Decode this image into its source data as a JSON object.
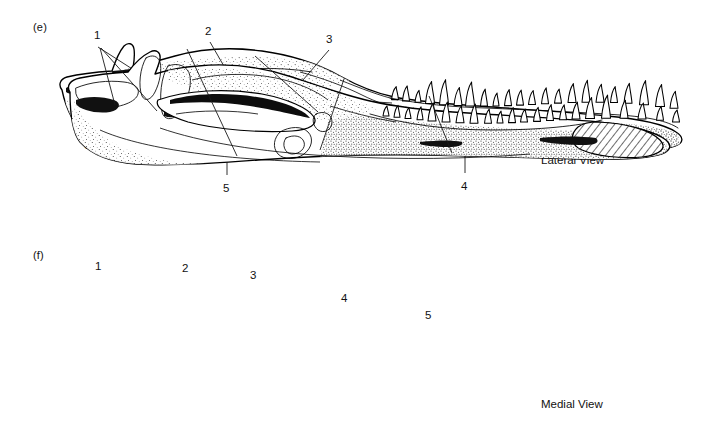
{
  "figure": {
    "background_color": "#ffffff",
    "ink_color": "#000000",
    "panels": [
      {
        "id": "e",
        "letter": "(e)",
        "caption": "Lateral View",
        "caption_x": 541,
        "caption_y": 154,
        "letter_x": 33,
        "letter_y": 21,
        "callouts": [
          {
            "number": "1",
            "label_x": 94,
            "label_y": 30,
            "line": "98,47 L 176,97"
          },
          {
            "number": "2",
            "label_x": 205,
            "label_y": 26,
            "line": "210,42 L 247,106"
          },
          {
            "number": "3",
            "label_x": 326,
            "label_y": 34,
            "line": "329,50 L 296,88"
          },
          {
            "number": "4",
            "label_x": 461,
            "label_y": 181,
            "line": "465,173 L 465,115"
          },
          {
            "number": "5",
            "label_x": 223,
            "label_y": 183,
            "line": "227,175 L 227,116"
          },
          {
            "number": "6",
            "label_x": 84,
            "label_y": 140,
            "line": "90,136 L 73,100"
          }
        ]
      },
      {
        "id": "f",
        "letter": "(f)",
        "caption": "Medial View",
        "caption_x": 541,
        "caption_y": 398,
        "letter_x": 33,
        "letter_y": 249,
        "callouts": [
          {
            "number": "1",
            "label_x": 95,
            "label_y": 261,
            "line": "100,278 L 115,335"
          },
          {
            "number": "1b",
            "number_hidden": true,
            "line": "101,278 L 157,341"
          },
          {
            "number": "2",
            "label_x": 182,
            "label_y": 263,
            "line": "187,279 L 237,386"
          },
          {
            "number": "3",
            "label_x": 250,
            "label_y": 270,
            "line": "255,286 L 318,342"
          },
          {
            "number": "4",
            "label_x": 341,
            "label_y": 293,
            "line": "344,309 L 320,380"
          },
          {
            "number": "5",
            "label_x": 425,
            "label_y": 310,
            "line": "429,326 L 452,383"
          }
        ]
      }
    ]
  },
  "art": {
    "lateral": {
      "jaw_outline": "M 62,90 C 58,85 60,79 67,77 C 80,74 98,72 112,71 C 115,62 119,52 124,46 C 128,42 133,43 134,49 C 135,55 134,62 133,68 C 146,64 160,60 175,56 C 200,49 232,47 262,51 C 292,55 318,64 340,76 C 358,86 375,93 394,97 C 420,102 450,104 478,106 C 520,109 566,112 607,116 C 640,119 664,124 676,132 C 684,137 684,143 675,146 C 660,151 634,152 604,151 C 560,150 505,148 455,147 C 400,146 340,148 286,152 C 232,156 186,159 152,158 C 124,157 104,151 90,140 C 76,129 66,110 62,90 Z",
      "ramus_upper_edge": "M 86,92 C 120,86 156,80 196,74 C 236,68 276,66 312,72",
      "ramus_lower_edge": "M 76,104 C 110,116 150,128 196,136 C 250,145 310,149 366,148",
      "coronoid_ridge": "M 128,72 C 150,80 176,88 206,92 C 236,96 264,94 286,86",
      "surangular_line": "M 300,72 C 322,78 344,86 362,95 C 376,102 388,106 400,108",
      "angular_line": "M 330,96 C 350,100 372,102 392,103",
      "glenoid": "M 176,86 C 192,78 214,77 234,82 C 256,88 268,100 266,112 C 264,124 248,130 228,128 C 206,126 186,116 178,104 C 174,97 173,90 176,86 Z",
      "fenestra": "M 196,112 C 216,104 246,102 274,106 C 298,110 316,118 322,126 C 326,132 320,138 306,140 C 284,143 252,142 226,136 C 206,131 194,122 196,112 Z",
      "fenestra_inner": "M 216,124 C 234,120 258,120 276,124 C 288,127 290,131 282,133 C 266,136 240,135 224,131 C 215,128 212,125 216,124 Z"
    },
    "medial": {
      "jaw_outline": "M 70,322 C 66,316 70,310 80,308 C 95,305 112,303 128,302 C 134,294 142,286 150,282 C 156,279 161,282 160,289 C 159,294 157,299 155,304 C 168,300 182,297 198,296 C 228,293 262,297 292,307 C 318,316 344,325 370,331 C 400,338 434,341 468,343 C 512,346 558,348 598,352 C 634,356 656,362 666,370 C 673,376 670,382 658,385 C 640,389 612,390 580,389 C 534,388 480,386 428,385 C 372,384 312,386 258,390 C 208,394 166,396 136,394 C 110,392 92,385 80,372 C 72,362 70,342 70,322 Z",
      "retroarticular": "M 76,318 C 90,312 108,310 124,312 C 134,313 140,318 138,324 C 136,332 120,338 102,338 C 88,338 78,332 76,324 Z",
      "coronoid_process": "M 146,288 C 152,284 158,286 160,292 C 162,300 160,312 155,322 C 151,330 145,332 142,326 C 138,316 140,298 146,288 Z",
      "internal_fenestra": "M 158,330 C 186,320 226,318 262,324 C 288,329 308,338 314,347 C 318,354 310,360 292,361 C 262,363 218,360 188,352 C 166,345 154,337 158,330 Z",
      "splenial_groove": "M 176,344 C 200,340 232,340 258,344",
      "meckelian": "M 280,362 C 290,356 302,356 308,362 C 314,368 312,378 304,384 C 296,390 284,390 278,384 C 272,377 274,368 280,362 Z",
      "meckelian_inner": "M 286,368 C 294,364 302,366 304,372 C 306,378 300,384 292,384 C 285,384 281,374 286,368 Z",
      "symphysis_hatch": "M 598,352 C 626,353 650,360 660,370 C 668,378 660,385 642,387 C 620,389 596,386 582,380 C 570,375 570,364 578,357 C 583,353 590,352 598,352 Z",
      "alveolar_edge": "M 370,344 C 404,354 446,360 492,360 C 540,360 578,356 602,350",
      "inner_ridge": "M 160,358 C 200,372 260,382 330,386 C 400,390 470,389 530,384"
    },
    "teeth_lateral": [
      {
        "x": 395,
        "h": 13,
        "w": 7
      },
      {
        "x": 406,
        "h": 15,
        "w": 7
      },
      {
        "x": 418,
        "h": 12,
        "w": 6
      },
      {
        "x": 430,
        "h": 22,
        "w": 9
      },
      {
        "x": 444,
        "h": 25,
        "w": 9
      },
      {
        "x": 458,
        "h": 18,
        "w": 8
      },
      {
        "x": 470,
        "h": 24,
        "w": 9
      },
      {
        "x": 484,
        "h": 17,
        "w": 7
      },
      {
        "x": 496,
        "h": 13,
        "w": 6
      },
      {
        "x": 508,
        "h": 16,
        "w": 7
      },
      {
        "x": 520,
        "h": 15,
        "w": 7
      },
      {
        "x": 532,
        "h": 14,
        "w": 7
      },
      {
        "x": 545,
        "h": 16,
        "w": 7
      },
      {
        "x": 558,
        "h": 14,
        "w": 7
      },
      {
        "x": 572,
        "h": 19,
        "w": 8
      },
      {
        "x": 586,
        "h": 22,
        "w": 8
      },
      {
        "x": 600,
        "h": 18,
        "w": 8
      },
      {
        "x": 614,
        "h": 16,
        "w": 7
      },
      {
        "x": 628,
        "h": 20,
        "w": 8
      },
      {
        "x": 644,
        "h": 24,
        "w": 9
      },
      {
        "x": 660,
        "h": 22,
        "w": 9
      },
      {
        "x": 674,
        "h": 17,
        "w": 8
      }
    ],
    "teeth_medial": [
      {
        "x": 386,
        "h": 10,
        "w": 6
      },
      {
        "x": 397,
        "h": 12,
        "w": 6
      },
      {
        "x": 408,
        "h": 11,
        "w": 6
      },
      {
        "x": 420,
        "h": 13,
        "w": 6
      },
      {
        "x": 432,
        "h": 18,
        "w": 8
      },
      {
        "x": 446,
        "h": 20,
        "w": 8
      },
      {
        "x": 460,
        "h": 17,
        "w": 8
      },
      {
        "x": 474,
        "h": 19,
        "w": 8
      },
      {
        "x": 488,
        "h": 14,
        "w": 7
      },
      {
        "x": 500,
        "h": 12,
        "w": 6
      },
      {
        "x": 512,
        "h": 15,
        "w": 7
      },
      {
        "x": 524,
        "h": 13,
        "w": 7
      },
      {
        "x": 537,
        "h": 14,
        "w": 7
      },
      {
        "x": 550,
        "h": 16,
        "w": 7
      },
      {
        "x": 563,
        "h": 15,
        "w": 7
      },
      {
        "x": 576,
        "h": 17,
        "w": 8
      },
      {
        "x": 590,
        "h": 21,
        "w": 9
      },
      {
        "x": 606,
        "h": 23,
        "w": 9
      },
      {
        "x": 624,
        "h": 18,
        "w": 8
      },
      {
        "x": 642,
        "h": 16,
        "w": 8
      },
      {
        "x": 660,
        "h": 14,
        "w": 7
      },
      {
        "x": 676,
        "h": 12,
        "w": 7
      }
    ]
  }
}
